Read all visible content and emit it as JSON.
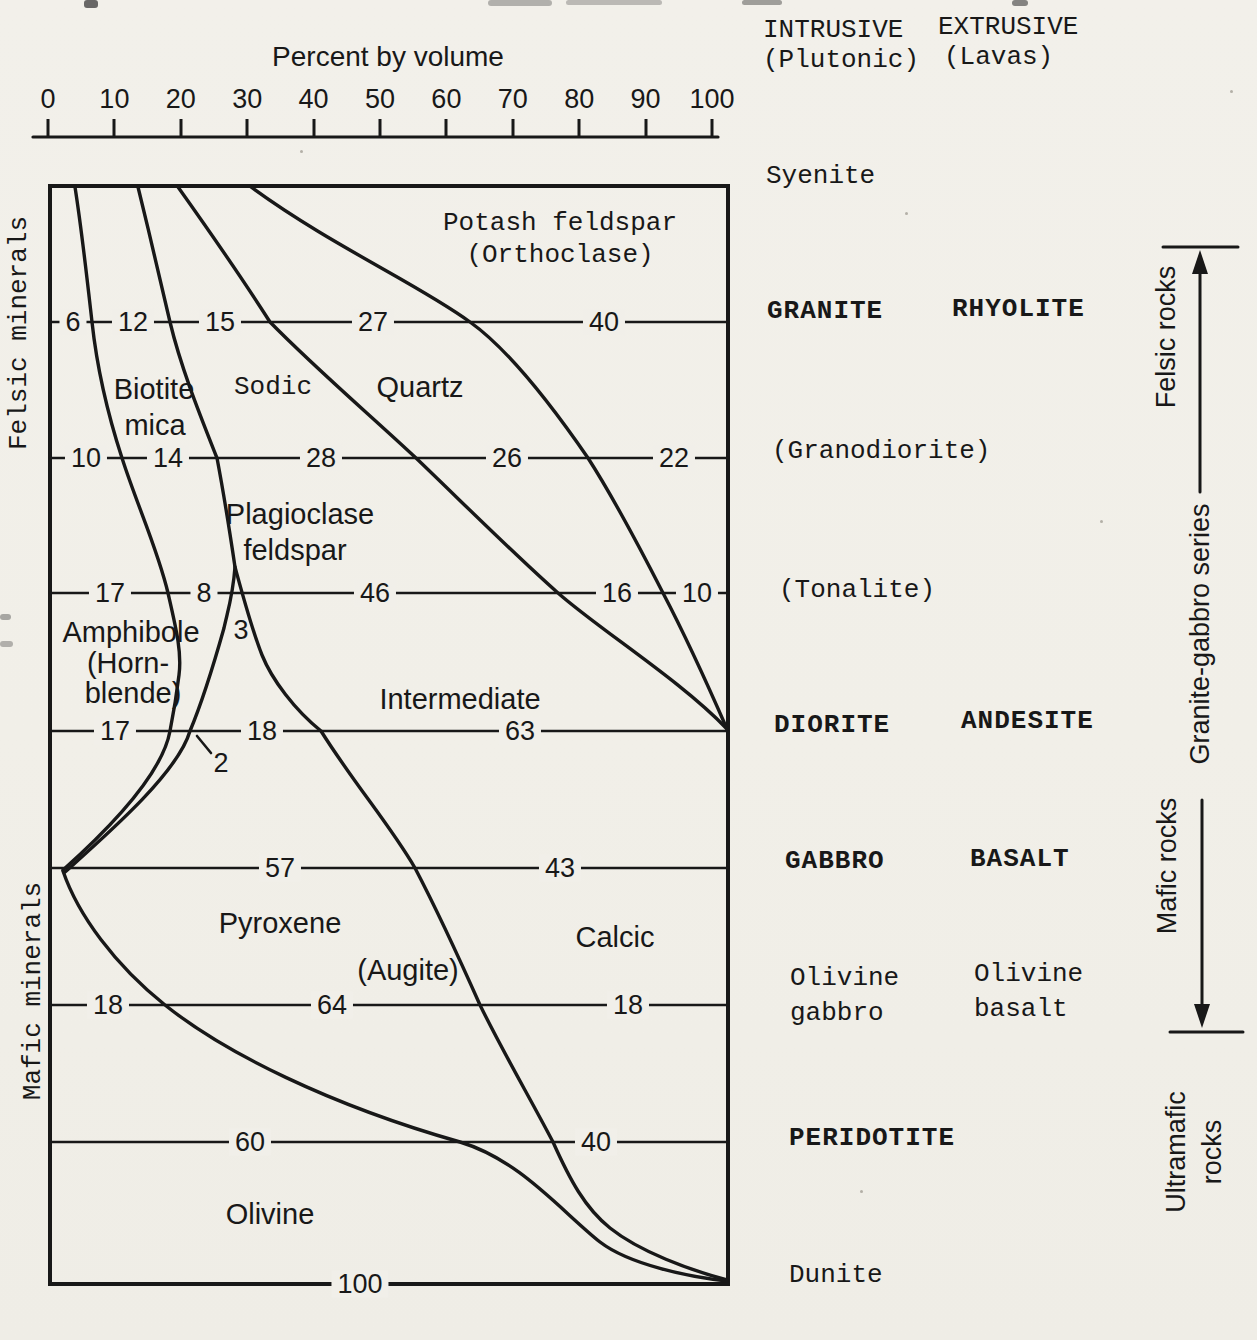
{
  "chart_data": {
    "type": "area",
    "title": "Percent by volume",
    "x_axis": {
      "title": "Percent by volume",
      "range": [
        0,
        100
      ],
      "ticks": [
        "0",
        "10",
        "20",
        "30",
        "40",
        "50",
        "60",
        "70",
        "80",
        "90",
        "100"
      ]
    },
    "mineral_fields": [
      "Potash feldspar (Orthoclase)",
      "Quartz",
      "Sodic plagioclase",
      "Plagioclase feldspar",
      "Biotite mica",
      "Amphibole (Hornblende)",
      "Intermediate plagioclase",
      "Pyroxene (Augite)",
      "Calcic plagioclase",
      "Olivine"
    ],
    "rock_rows": [
      {
        "intrusive": "Syenite",
        "extrusive": "",
        "values": []
      },
      {
        "intrusive": "GRANITE",
        "extrusive": "RHYOLITE",
        "values": [
          "6",
          "12",
          "15",
          "27",
          "40"
        ]
      },
      {
        "intrusive": "(Granodiorite)",
        "extrusive": "",
        "values": [
          "10",
          "14",
          "28",
          "26",
          "22"
        ]
      },
      {
        "intrusive": "(Tonalite)",
        "extrusive": "",
        "values": [
          "17",
          "8",
          "3",
          "46",
          "16",
          "10"
        ]
      },
      {
        "intrusive": "DIORITE",
        "extrusive": "ANDESITE",
        "values": [
          "17",
          "2",
          "18",
          "63"
        ]
      },
      {
        "intrusive": "GABBRO",
        "extrusive": "BASALT",
        "values": [
          "57",
          "43"
        ]
      },
      {
        "intrusive": "Olivine gabbro",
        "extrusive": "Olivine basalt",
        "intrusive_lines": [
          "Olivine",
          "gabbro"
        ],
        "extrusive_lines": [
          "Olivine",
          "basalt"
        ],
        "values": [
          "18",
          "64",
          "18"
        ]
      },
      {
        "intrusive": "PERIDOTITE",
        "extrusive": "",
        "values": [
          "60",
          "40"
        ]
      },
      {
        "intrusive": "Dunite",
        "extrusive": "",
        "values": [
          "100"
        ]
      }
    ]
  },
  "figure": {
    "column_headers": {
      "intrusive_line1": "INTRUSIVE",
      "intrusive_line2": "(Plutonic)",
      "extrusive_line1": "EXTRUSIVE",
      "extrusive_line2": "(Lavas)"
    },
    "left_labels": {
      "felsic": "Felsic minerals",
      "mafic": "Mafic minerals"
    },
    "minerals": {
      "potash_1": "Potash feldspar",
      "potash_2": "(Orthoclase)",
      "biotite_1": "Biotite",
      "biotite_2": "mica",
      "sodic": "Sodic",
      "quartz": "Quartz",
      "plagioclase_1": "Plagioclase",
      "plagioclase_2": "feldspar",
      "amphibole_1": "Amphibole",
      "amphibole_2": "(Horn-",
      "amphibole_3": "blende)",
      "intermediate": "Intermediate",
      "pyroxene": "Pyroxene",
      "augite": "(Augite)",
      "calcic": "Calcic",
      "olivine": "Olivine"
    },
    "side_labels": {
      "felsic": "Felsic rocks",
      "series": "Granite-gabbro series",
      "mafic": "Mafic rocks",
      "ultramafic_1": "Ultramafic",
      "ultramafic_2": "rocks"
    }
  }
}
